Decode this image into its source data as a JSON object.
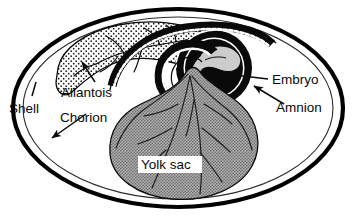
{
  "figure": {
    "type": "biological-diagram",
    "background_color": "#ffffff"
  },
  "labels": {
    "shell": "Shell",
    "chorion": "Chorion",
    "allantois": "Allantois",
    "embryo": "Embryo",
    "amnion": "Amnion",
    "yolk_sac": "Yolk sac"
  },
  "colors": {
    "outline": "#0a0a0a",
    "shell_stroke": "#000000",
    "chorion_stroke": "#2a2a2a",
    "yolk_fill": "#9a9a9a",
    "embryo_fill": "#cccccc",
    "allantois_fill": "#ffffff",
    "amnion_fill": "#000000",
    "label_box_fill": "#ffffff",
    "vessel_stroke": "#1a1a1a"
  },
  "structures": [
    {
      "name": "shell",
      "description": "thick black ellipse forming outer egg boundary"
    },
    {
      "name": "chorion",
      "description": "thin line just inside the shell"
    },
    {
      "name": "allantois",
      "description": "stippled lobe in upper left with branching vessels"
    },
    {
      "name": "amnion",
      "description": "black ring enclosing the embryo"
    },
    {
      "name": "embryo",
      "description": "light gray curled form inside the amnion"
    },
    {
      "name": "yolk_sac",
      "description": "large gray bulbous sac with vessel lines in lower center"
    }
  ],
  "leader_lines": [
    {
      "label": "shell",
      "arrow": false
    },
    {
      "label": "chorion",
      "arrow": true,
      "direction": "down-left"
    },
    {
      "label": "allantois",
      "arrow": true,
      "direction": "up-left"
    },
    {
      "label": "embryo",
      "arrow": true,
      "direction": "left"
    },
    {
      "label": "amnion",
      "arrow": true,
      "direction": "up-left"
    },
    {
      "label": "yolk_sac",
      "arrow": false
    }
  ]
}
